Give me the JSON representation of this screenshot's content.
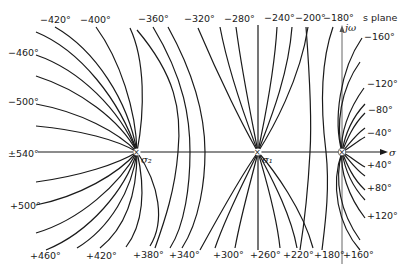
{
  "diagram": {
    "title": "s plane",
    "axes": {
      "real_label": "σ",
      "imag_label": "jω"
    },
    "poles": [
      {
        "id": "sigma2",
        "label": "σ₂",
        "x": 137,
        "y": 152
      },
      {
        "id": "sigma1",
        "label": "σ₁",
        "x": 258,
        "y": 152
      },
      {
        "id": "origin",
        "label": "",
        "x": 342,
        "y": 152
      }
    ],
    "pole_marker": "×",
    "top_labels": [
      {
        "text": "−420°",
        "x": 40,
        "y": 23
      },
      {
        "text": "−400°",
        "x": 80,
        "y": 23
      },
      {
        "text": "−360°",
        "x": 140,
        "y": 23
      },
      {
        "text": "−320°",
        "x": 184,
        "y": 23
      },
      {
        "text": "−280°",
        "x": 224,
        "y": 23
      },
      {
        "text": "−240°",
        "x": 264,
        "y": 22
      },
      {
        "text": "−200°",
        "x": 296,
        "y": 22
      },
      {
        "text": "−180°",
        "x": 324,
        "y": 22
      }
    ],
    "left_labels": [
      {
        "text": "−460°",
        "x": 8,
        "y": 56
      },
      {
        "text": "−500°",
        "x": 8,
        "y": 105
      },
      {
        "text": "±540°",
        "x": 8,
        "y": 158
      },
      {
        "text": "+500°",
        "x": 10,
        "y": 209
      }
    ],
    "bottom_labels": [
      {
        "text": "+460°",
        "x": 30,
        "y": 259
      },
      {
        "text": "+420°",
        "x": 86,
        "y": 259
      },
      {
        "text": "+380°",
        "x": 133,
        "y": 258
      },
      {
        "text": "+340°",
        "x": 169,
        "y": 258
      },
      {
        "text": "+300°",
        "x": 213,
        "y": 258
      },
      {
        "text": "+260°",
        "x": 250,
        "y": 258
      },
      {
        "text": "+220°",
        "x": 283,
        "y": 258
      },
      {
        "text": "+180°",
        "x": 314,
        "y": 258
      },
      {
        "text": "+160°",
        "x": 343,
        "y": 258
      }
    ],
    "right_labels": [
      {
        "text": "−160°",
        "x": 364,
        "y": 40
      },
      {
        "text": "−120°",
        "x": 367,
        "y": 87
      },
      {
        "text": "−80°",
        "x": 368,
        "y": 113
      },
      {
        "text": "−40°",
        "x": 367,
        "y": 136
      },
      {
        "text": "+40°",
        "x": 367,
        "y": 167
      },
      {
        "text": "+80°",
        "x": 367,
        "y": 190
      },
      {
        "text": "+120°",
        "x": 367,
        "y": 218
      }
    ]
  }
}
